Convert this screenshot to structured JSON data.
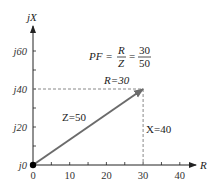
{
  "diagram": {
    "axes": {
      "x_label": "R",
      "y_label": "jX",
      "x_ticks": [
        "0",
        "10",
        "20",
        "30",
        "40"
      ],
      "x_tick_values": [
        0,
        10,
        20,
        30,
        40
      ],
      "x_minor_values": [
        5,
        15,
        25,
        35
      ],
      "y_ticks": [
        "j0",
        "j20",
        "j40",
        "j60"
      ],
      "y_tick_values": [
        0,
        20,
        40,
        60
      ],
      "y_minor_values": [
        10,
        30,
        50
      ]
    },
    "vector": {
      "label": "Z=50",
      "R": 30,
      "X": 40,
      "color": "#6b6b6b"
    },
    "labels": {
      "r_label": "R=30",
      "x_label": "X=40",
      "z_label": "Z=50"
    },
    "formula": {
      "lhs": "PF",
      "eq1": "=",
      "frac1_num": "R",
      "frac1_den": "Z",
      "eq2": "=",
      "frac2_num": "30",
      "frac2_den": "50"
    },
    "colors": {
      "axis": "#222222",
      "dashed": "#888888",
      "vector": "#6b6b6b",
      "origin_dot": "#000000"
    }
  }
}
